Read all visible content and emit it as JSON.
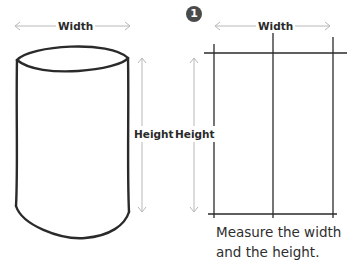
{
  "left_figure": {
    "name": "cylinder",
    "width_label": "Width",
    "height_label": "Height"
  },
  "right_figure": {
    "name": "grid-rectangle",
    "step_number": "1",
    "width_label": "Width",
    "height_label": "Height",
    "caption_lines": [
      "Measure the width",
      "and the height."
    ]
  },
  "colors": {
    "line": "#2a2a2a",
    "arrow": "#b8b8b8",
    "badge": "#4a4a4a"
  }
}
